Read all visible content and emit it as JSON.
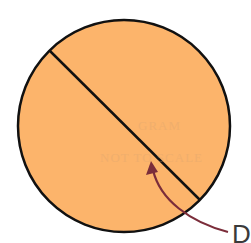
{
  "diagram": {
    "shapes": {
      "circle": {
        "cx": 124,
        "cy": 126,
        "r": 106,
        "fill": "#fcb46b",
        "stroke": "#111111"
      },
      "diameter_line": {
        "x1": 50,
        "y1": 51,
        "x2": 200,
        "y2": 200,
        "stroke": "#111111"
      },
      "arrow": {
        "color": "#7b2d3a",
        "from": [
          228,
          232
        ],
        "to": [
          152,
          163
        ]
      }
    },
    "label": "D",
    "bleed_through_text": [
      "GRAM",
      "NOT TO SCALE"
    ]
  }
}
